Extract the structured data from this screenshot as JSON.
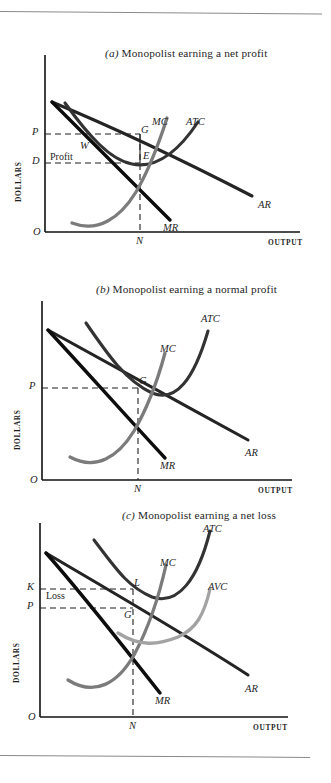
{
  "figure": {
    "kind": "economics-textbook-figure",
    "panel_count": 3,
    "curve_colors": {
      "demand_ar": "#1c1c1c",
      "marginal_revenue": "#0d0d0d",
      "atc": "#2e2e2e",
      "mc": "#6f6f6f",
      "avc": "#9a9a9a",
      "dashed_guide": "#1f1f1f",
      "axis": "#111111",
      "rule": "#8a8a8a"
    }
  },
  "panels": [
    {
      "id": "a",
      "caption_tag": "(a)",
      "caption_text": "Monopolist earning a net profit",
      "axis": {
        "y_label": "DOLLARS",
        "x_label": "OUTPUT",
        "origin_label": "O"
      },
      "y_ticks": [
        {
          "label": "P"
        },
        {
          "label": "D"
        }
      ],
      "x_ticks": [
        {
          "label": "N"
        }
      ],
      "curve_labels": [
        {
          "label": "MC"
        },
        {
          "label": "ATC"
        },
        {
          "label": "AR"
        },
        {
          "label": "MR"
        }
      ],
      "point_labels": [
        {
          "label": "G"
        },
        {
          "label": "W"
        },
        {
          "label": "E"
        }
      ],
      "area_labels": [
        {
          "label": "Profit"
        }
      ]
    },
    {
      "id": "b",
      "caption_tag": "(b)",
      "caption_text": "Monopolist earning a normal profit",
      "axis": {
        "y_label": "DOLLARS",
        "x_label": "OUTPUT",
        "origin_label": "O"
      },
      "y_ticks": [
        {
          "label": "P"
        }
      ],
      "x_ticks": [
        {
          "label": "N"
        }
      ],
      "curve_labels": [
        {
          "label": "ATC"
        },
        {
          "label": "MC"
        },
        {
          "label": "AR"
        },
        {
          "label": "MR"
        }
      ],
      "point_labels": [
        {
          "label": "G"
        }
      ],
      "area_labels": []
    },
    {
      "id": "c",
      "caption_tag": "(c)",
      "caption_text": "Monopolist earning a net loss",
      "axis": {
        "y_label": "DOLLARS",
        "x_label": "OUTPUT",
        "origin_label": "O"
      },
      "y_ticks": [
        {
          "label": "K"
        },
        {
          "label": "P"
        }
      ],
      "x_ticks": [
        {
          "label": "N"
        }
      ],
      "curve_labels": [
        {
          "label": "ATC"
        },
        {
          "label": "MC"
        },
        {
          "label": "AVC"
        },
        {
          "label": "AR"
        },
        {
          "label": "MR"
        }
      ],
      "point_labels": [
        {
          "label": "L"
        },
        {
          "label": "G"
        }
      ],
      "area_labels": [
        {
          "label": "Loss"
        }
      ]
    }
  ]
}
